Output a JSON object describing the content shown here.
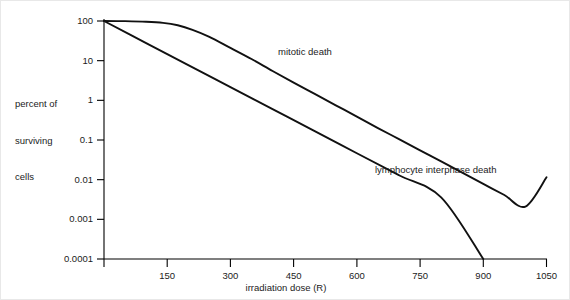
{
  "figure": {
    "background_color": "#ffffff",
    "axis_color": "#000000",
    "curve_color": "#111111"
  },
  "axes": {
    "y_title_lines": [
      "percent of",
      "surviving",
      "cells"
    ],
    "x_title": "irradiation dose (R)",
    "y_tick_labels": [
      "100",
      "10",
      "1",
      "0.1",
      "0.01",
      "0.001",
      "0.0001"
    ],
    "x_tick_labels": [
      "150",
      "300",
      "450",
      "600",
      "750",
      "900",
      "1050"
    ]
  },
  "annotations": {
    "mitotic_label": "mitotic death",
    "lymphocyte_label": "lymphocyte interphase death"
  },
  "chart_data": {
    "type": "line",
    "title": "",
    "xlabel": "irradiation dose (R)",
    "ylabel": "percent of surviving cells",
    "xlim": [
      0,
      1050
    ],
    "ylim": [
      0.0001,
      100
    ],
    "yscale": "log",
    "xscale": "linear",
    "grid": false,
    "legend": "inline-annotation",
    "x_ticks": [
      150,
      300,
      450,
      600,
      750,
      900,
      1050
    ],
    "y_ticks": [
      100,
      10,
      1,
      0.1,
      0.01,
      0.001,
      0.0001
    ],
    "series": [
      {
        "name": "mitotic death",
        "color": "#111111",
        "label_position": {
          "x": 420,
          "y": 22
        },
        "x": [
          0,
          50,
          100,
          140,
          175,
          210,
          250,
          300,
          350,
          400,
          450,
          500,
          550,
          600,
          650,
          700,
          750,
          800,
          850,
          900,
          950,
          1000,
          1050
        ],
        "y": [
          100,
          99,
          96,
          90,
          78,
          60,
          40,
          21,
          11,
          5.5,
          2.8,
          1.45,
          0.75,
          0.39,
          0.2,
          0.105,
          0.055,
          0.029,
          0.015,
          0.0078,
          0.0041,
          0.0021,
          0.0115
        ]
      },
      {
        "name": "lymphocyte interphase death",
        "color": "#111111",
        "label_position": {
          "x": 560,
          "y": 0.018
        },
        "x": [
          0,
          100,
          200,
          300,
          400,
          500,
          600,
          700,
          800,
          900
        ],
        "y": [
          100,
          27.8,
          7.74,
          2.15,
          0.6,
          0.167,
          0.0464,
          0.0129,
          0.00359,
          0.0001
        ]
      }
    ],
    "notes": [
      "Semi-logarithmic survival curve.",
      "Mitotic death curve shows an initial shoulder (near 100% survival to about 140 R) then a straight exponential decline, reaching about 0.012 percent at 1050 R.",
      "Lymphocyte interphase death declines exponentially from the origin and reaches 0.0001 percent at about 900 R."
    ]
  }
}
